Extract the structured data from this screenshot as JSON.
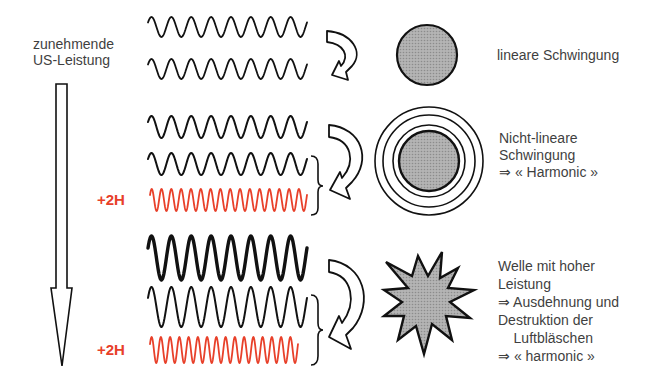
{
  "left_label": {
    "line1": "zunehmende",
    "line2": "US-Leistung"
  },
  "rows": [
    {
      "id": "linear",
      "waves": [
        {
          "color": "#111111",
          "x0": 148,
          "x1": 307,
          "cy": 27,
          "amp": 10,
          "cycles": 8,
          "stroke": 1.8
        },
        {
          "color": "#111111",
          "x0": 148,
          "x1": 307,
          "cy": 69,
          "amp": 10,
          "cycles": 8,
          "stroke": 1.8
        }
      ],
      "harmonic_label": "",
      "shape": "circle",
      "description": [
        "lineare Schwingung"
      ]
    },
    {
      "id": "nonlinear",
      "waves": [
        {
          "color": "#111111",
          "x0": 148,
          "x1": 307,
          "cy": 127,
          "amp": 11,
          "cycles": 8,
          "stroke": 2.0
        },
        {
          "color": "#111111",
          "x0": 148,
          "x1": 307,
          "cy": 164,
          "amp": 11,
          "cycles": 8,
          "stroke": 2.0
        },
        {
          "color": "#e8402a",
          "x0": 150,
          "x1": 307,
          "cy": 200,
          "amp": 11,
          "cycles": 16,
          "stroke": 1.8
        }
      ],
      "harmonic_label": "+2H",
      "shape": "concentric-circles",
      "description": [
        "Nicht-lineare",
        "Schwingung",
        "⇒ « Harmonic »"
      ]
    },
    {
      "id": "high-power",
      "waves": [
        {
          "color": "#111111",
          "x0": 148,
          "x1": 307,
          "cy": 258,
          "amp": 22,
          "cycles": 8,
          "stroke": 3.4
        },
        {
          "color": "#111111",
          "x0": 148,
          "x1": 307,
          "cy": 307,
          "amp": 20,
          "cycles": 8,
          "stroke": 2.0
        },
        {
          "color": "#e8402a",
          "x0": 150,
          "x1": 298,
          "cy": 350,
          "amp": 13,
          "cycles": 16,
          "stroke": 1.8
        }
      ],
      "harmonic_label": "+2H",
      "shape": "starburst",
      "description": [
        "Welle mit hoher",
        "Leistung",
        "⇒ Ausdehnung und",
        "Destruktion der",
        "    Luftbläschen",
        "⇒ « harmonic »"
      ]
    }
  ],
  "colors": {
    "ink": "#111111",
    "harmonic_red": "#e8402a",
    "bubble_fill": "#a9a9a9",
    "text": "#3f3f3f"
  }
}
